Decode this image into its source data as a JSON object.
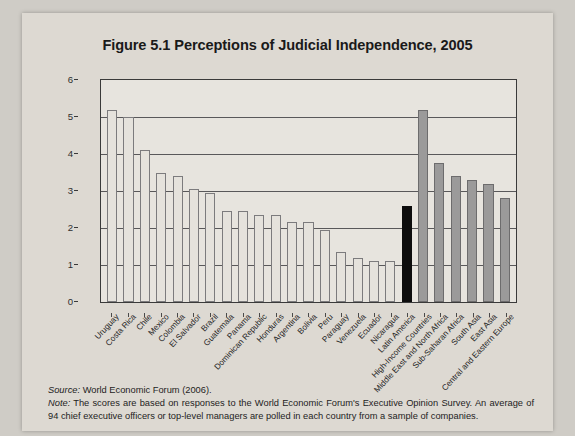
{
  "figure": {
    "title": "Figure 5.1 Perceptions of Judicial Independence, 2005"
  },
  "notes": {
    "source_label": "Source:",
    "source_text": " World Economic Forum (2006).",
    "note_label": "Note:",
    "note_text": " The scores are based on responses to the World Economic Forum's Executive Opinion Survey. An average of 94 chief executive officers or top-level managers are polled in each country from a sample of companies."
  },
  "colors": {
    "country_bar": "#e5e2dc",
    "country_bar_border": "#7c7b7d",
    "aggregate_bar": "#0d0d0d",
    "region_bar": "#9b9a9a",
    "region_bar_border": "#6d6c6d",
    "axis": "#3a3a3a",
    "gridline": "#59585a",
    "plot_background": "#e7e4de",
    "page_background": "#ddd9d2"
  },
  "chart_data": {
    "type": "bar",
    "title": "Figure 5.1 Perceptions of Judicial Independence, 2005",
    "xlabel": "",
    "ylabel": "",
    "ylim": [
      0,
      6
    ],
    "yticks": [
      0,
      1,
      2,
      3,
      4,
      5,
      6
    ],
    "ytick_labels": [
      "0",
      "1",
      "2",
      "3",
      "4",
      "5",
      "6"
    ],
    "grid": true,
    "legend": "none",
    "orientation": "vertical",
    "categories": [
      "Uruguay",
      "Costa Rica",
      "Chile",
      "Mexico",
      "Colombia",
      "El Salvador",
      "Brazil",
      "Guatemala",
      "Panama",
      "Dominican Republic",
      "Honduras",
      "Argentina",
      "Bolivia",
      "Peru",
      "Paraguay",
      "Venezuela",
      "Ecuador",
      "Nicaragua",
      "Latin America",
      "High-Income Countries",
      "Middle East and North Africa",
      "Sub-Saharan Africa",
      "South Asia",
      "East Asia",
      "Central and Eastern Europe"
    ],
    "values": [
      5.2,
      5.0,
      4.1,
      3.5,
      3.4,
      3.05,
      2.95,
      2.45,
      2.45,
      2.35,
      2.35,
      2.15,
      2.15,
      1.95,
      1.35,
      1.2,
      1.1,
      1.1,
      2.6,
      5.2,
      3.75,
      3.4,
      3.3,
      3.2,
      2.8
    ],
    "groups": [
      "country",
      "country",
      "country",
      "country",
      "country",
      "country",
      "country",
      "country",
      "country",
      "country",
      "country",
      "country",
      "country",
      "country",
      "country",
      "country",
      "country",
      "country",
      "aggregate",
      "region",
      "region",
      "region",
      "region",
      "region",
      "region"
    ]
  }
}
